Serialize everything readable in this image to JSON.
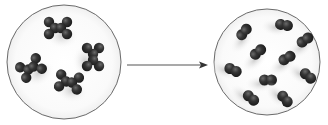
{
  "diagram": {
    "type": "reaction-schematic",
    "background": "#ffffff",
    "atom_color": "#2e2e2e",
    "circle_stroke": "#6a6a6a",
    "arrow_color": "#333333",
    "left_panel": {
      "label": "",
      "center": [
        64,
        62
      ],
      "radius": 57,
      "molecule_type": "six-atom X-shaped cluster",
      "molecules": [
        {
          "cx": 58,
          "cy": 28,
          "rot": 0
        },
        {
          "cx": 93,
          "cy": 57,
          "rot": 90
        },
        {
          "cx": 31,
          "cy": 68,
          "rot": -30
        },
        {
          "cx": 69,
          "cy": 82,
          "rot": 10
        }
      ]
    },
    "arrow": {
      "x1": 127,
      "y1": 65,
      "x2": 208,
      "y2": 65
    },
    "right_panel": {
      "label": "",
      "center": [
        267,
        62
      ],
      "radius": 53,
      "molecule_type": "diatomic pair",
      "molecules": [
        {
          "cx": 244,
          "cy": 32,
          "rot": -50
        },
        {
          "cx": 284,
          "cy": 25,
          "rot": 10
        },
        {
          "cx": 305,
          "cy": 40,
          "rot": -35
        },
        {
          "cx": 258,
          "cy": 52,
          "rot": -40
        },
        {
          "cx": 287,
          "cy": 58,
          "rot": -30
        },
        {
          "cx": 233,
          "cy": 70,
          "rot": 25
        },
        {
          "cx": 268,
          "cy": 80,
          "rot": 0
        },
        {
          "cx": 308,
          "cy": 76,
          "rot": 40
        },
        {
          "cx": 251,
          "cy": 98,
          "rot": 40
        },
        {
          "cx": 285,
          "cy": 99,
          "rot": 50
        }
      ]
    }
  }
}
